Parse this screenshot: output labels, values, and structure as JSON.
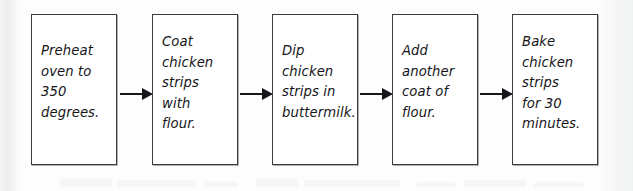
{
  "document": {
    "type": "handwritten-style flowchart",
    "topic": "Breaded baked chicken strips recipe steps",
    "background_color": "#fdfdfd",
    "ink_color": "#151518",
    "box_border_color": "#3b3b40"
  },
  "flowchart": {
    "orientation": "left-to-right",
    "step_count": 5,
    "arrow_count": 4,
    "arrow_glyph": "→",
    "steps": [
      {
        "index": 1,
        "text": "Preheat\noven to\n350\ndegrees.",
        "lines": [
          "Preheat",
          "oven to",
          "350",
          "degrees."
        ],
        "line_count": 4,
        "name": "preheat-oven"
      },
      {
        "index": 2,
        "text": "Coat\nchicken\nstrips\nwith\nflour.",
        "lines": [
          "Coat",
          "chicken",
          "strips",
          "with",
          "flour."
        ],
        "line_count": 5,
        "name": "coat-with-flour"
      },
      {
        "index": 3,
        "text": "Dip\nchicken\nstrips in\nbuttermilk.",
        "lines": [
          "Dip",
          "chicken",
          "strips in",
          "buttermilk."
        ],
        "line_count": 4,
        "name": "dip-in-buttermilk"
      },
      {
        "index": 4,
        "text": "Add\nanother\ncoat of\nflour.",
        "lines": [
          "Add",
          "another",
          "coat of",
          "flour."
        ],
        "line_count": 4,
        "name": "second-flour-coat"
      },
      {
        "index": 5,
        "text": "Bake\nchicken\nstrips\nfor 30\nminutes.",
        "lines": [
          "Bake",
          "chicken",
          "strips",
          "for 30",
          "minutes."
        ],
        "line_count": 5,
        "name": "bake-chicken"
      }
    ]
  }
}
